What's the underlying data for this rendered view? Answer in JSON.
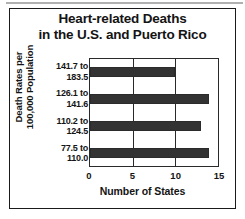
{
  "chart_data": {
    "type": "bar",
    "orientation": "horizontal",
    "title": "Heart-related Deaths in the U.S. and Puerto Rico",
    "title_lines": [
      "Heart-related Deaths",
      "in the U.S. and Puerto Rico"
    ],
    "ylabel": "Death Rates per 100,000 Population",
    "ylabel_lines": [
      "Death Rates per",
      "100,000 Population"
    ],
    "xlabel": "Number of States",
    "categories": [
      "141.7 to 183.5",
      "126.1 to 141.6",
      "110.2 to 124.5",
      "77.5 to 110.0"
    ],
    "category_lines": [
      [
        "141.7 to",
        "183.5"
      ],
      [
        "126.1 to",
        "141.6"
      ],
      [
        "110.2 to",
        "124.5"
      ],
      [
        "77.5 to",
        "110.0"
      ]
    ],
    "values": [
      10,
      14,
      13,
      14
    ],
    "xlim": [
      0,
      15
    ],
    "xticks": [
      0,
      5,
      10,
      15
    ],
    "xtick_labels": [
      "0",
      "5",
      "10",
      "15"
    ],
    "grid": true,
    "legend": false,
    "bar_color": "#333333",
    "frame_color": "#2a2a2a",
    "text_color": "#141414",
    "background": "#ffffff"
  }
}
